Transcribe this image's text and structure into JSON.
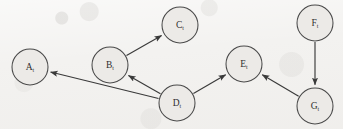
{
  "figure": {
    "kind": "directed-graph",
    "background_color": "#f3f2f0",
    "node_fill_color": "#eceae7",
    "node_stroke_color": "#4a4a4a",
    "edge_color": "#3a3a3a",
    "label_color": "#2e2e2e",
    "node_radius": 18
  },
  "nodes": [
    {
      "id": "A",
      "label": "A",
      "subscript": "t",
      "cx": 30,
      "cy": 67
    },
    {
      "id": "B",
      "label": "B",
      "subscript": "t",
      "cx": 110,
      "cy": 65
    },
    {
      "id": "C",
      "label": "C",
      "subscript": "t",
      "cx": 180,
      "cy": 25
    },
    {
      "id": "D",
      "label": "D",
      "subscript": "t",
      "cx": 177,
      "cy": 103
    },
    {
      "id": "E",
      "label": "E",
      "subscript": "t",
      "cx": 244,
      "cy": 64
    },
    {
      "id": "F",
      "label": "F",
      "subscript": "t",
      "cx": 315,
      "cy": 23
    },
    {
      "id": "G",
      "label": "G",
      "subscript": "t",
      "cx": 315,
      "cy": 106
    }
  ],
  "edges": [
    {
      "id": "edge-b-c",
      "from": "B",
      "to": "C",
      "arrow": "to"
    },
    {
      "id": "edge-d-b",
      "from": "D",
      "to": "B",
      "arrow": "to"
    },
    {
      "id": "edge-d-a",
      "from": "D",
      "to": "A",
      "arrow": "to"
    },
    {
      "id": "edge-d-e",
      "from": "D",
      "to": "E",
      "arrow": "to"
    },
    {
      "id": "edge-g-e",
      "from": "G",
      "to": "E",
      "arrow": "to"
    },
    {
      "id": "edge-f-g",
      "from": "F",
      "to": "G",
      "arrow": "to"
    }
  ]
}
